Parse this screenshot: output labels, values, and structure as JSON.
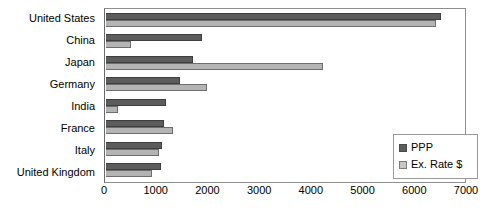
{
  "chart_data": {
    "type": "bar",
    "orientation": "horizontal",
    "title": "",
    "subtitle": "",
    "xlabel": "",
    "ylabel": "",
    "categories": [
      "United States",
      "China",
      "Japan",
      "Germany",
      "India",
      "France",
      "Italy",
      "United Kingdom"
    ],
    "series": [
      {
        "name": "PPP",
        "color": "#5c5c5c",
        "values": [
          6550,
          1880,
          1700,
          1440,
          1170,
          1140,
          1100,
          1080
        ]
      },
      {
        "name": "Ex. Rate $",
        "color": "#b4b4b4",
        "values": [
          6450,
          480,
          4250,
          1980,
          230,
          1310,
          1040,
          900
        ]
      }
    ],
    "xlim": [
      0,
      7000
    ],
    "xticks": [
      0,
      1000,
      2000,
      3000,
      4000,
      5000,
      6000,
      7000
    ],
    "xtick_labels": [
      "0",
      "1000",
      "2000",
      "3000",
      "4000",
      "5000",
      "6000",
      "7000"
    ],
    "grid": false,
    "legend_position": "bottom-right",
    "legend_entries": [
      "PPP",
      "Ex. Rate $"
    ]
  },
  "legend": {
    "items": [
      {
        "label": "PPP",
        "swatch": "ppp"
      },
      {
        "label": "Ex. Rate $",
        "swatch": "exrate"
      }
    ]
  }
}
